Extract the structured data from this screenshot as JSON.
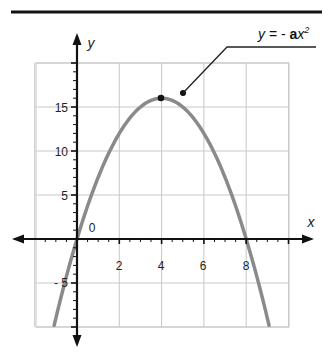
{
  "chart_data": {
    "type": "line",
    "title": "",
    "annotation": {
      "text_y": "y",
      "text_eq": " = - ",
      "text_a": "a",
      "text_x": "x",
      "text_exp": "2",
      "full": "y = - ax²"
    },
    "xlabel": "x",
    "ylabel": "y",
    "origin_label": "0",
    "xlim": [
      -3,
      10
    ],
    "ylim": [
      -10,
      20
    ],
    "x_ticks": [
      2,
      4,
      6,
      8
    ],
    "y_ticks": [
      15,
      10,
      5,
      -5
    ],
    "x_tick_labels": [
      "2",
      "4",
      "6",
      "8"
    ],
    "y_tick_labels": [
      "15",
      "10",
      "5",
      "- 5"
    ],
    "grid": true,
    "series": [
      {
        "name": "y = -x^2 + 8x",
        "color": "#8a8a8a",
        "x": [
          -1,
          0,
          1,
          2,
          3,
          4,
          5,
          6,
          7,
          8,
          9
        ],
        "y": [
          -9,
          0,
          7,
          12,
          15,
          16,
          15,
          12,
          7,
          0,
          -9
        ]
      }
    ],
    "points": [
      {
        "label": "vertex",
        "x": 4,
        "y": 16
      }
    ]
  },
  "colors": {
    "axis": "#111111",
    "grid": "#c8c8c8",
    "curve": "#8a8a8a",
    "rule": "#111111"
  }
}
